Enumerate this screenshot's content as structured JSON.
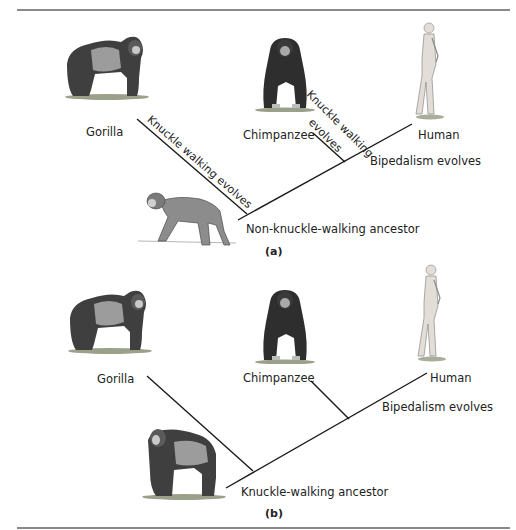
{
  "panel_a": {
    "caption": "(a)",
    "taxa": {
      "gorilla": "Gorilla",
      "chimpanzee": "Chimpanzee",
      "human": "Human",
      "ancestor": "Non-knuckle-walking ancestor"
    },
    "annotations": {
      "gorilla_branch": "Knuckle walking evolves",
      "chimp_branch_line1": "Knuckle walking",
      "chimp_branch_line2": "evolves",
      "human_branch": "Bipedalism evolves"
    }
  },
  "panel_b": {
    "caption": "(b)",
    "taxa": {
      "gorilla": "Gorilla",
      "chimpanzee": "Chimpanzee",
      "human": "Human",
      "ancestor": "Knuckle-walking ancestor"
    },
    "annotations": {
      "human_branch": "Bipedalism evolves"
    }
  },
  "colors": {
    "line": "#1a1a1a",
    "rule": "#8a8a8a",
    "ape_dark": "#3a3a3a",
    "ape_mid": "#7a7a7a",
    "ape_light": "#b8b8b8",
    "human_skin": "#e2ddd6"
  }
}
